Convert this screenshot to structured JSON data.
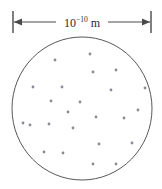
{
  "figure": {
    "colors": {
      "background": "#ffffff",
      "circle_stroke": "#575757",
      "dimension_line": "#4a4a4a",
      "particle": "#8a8a94",
      "label_text": "#2b2b2b"
    },
    "scale_bar": {
      "label_mantissa": "10",
      "label_exponent": "−10",
      "label_unit": "m",
      "label_full": "10⁻¹⁰ m",
      "left_x": 13,
      "right_x": 151,
      "line_y": 22,
      "tick_top_y": 11,
      "tick_bottom_y": 33,
      "arrow_direction": "double"
    },
    "circle": {
      "center_x": 82,
      "center_y": 108.5,
      "radius_x": 70,
      "radius_y": 71.5
    },
    "particles": [
      {
        "x": 90,
        "y": 54
      },
      {
        "x": 55,
        "y": 60
      },
      {
        "x": 93,
        "y": 72
      },
      {
        "x": 116,
        "y": 70
      },
      {
        "x": 33,
        "y": 87
      },
      {
        "x": 62,
        "y": 87
      },
      {
        "x": 111,
        "y": 90
      },
      {
        "x": 145,
        "y": 88
      },
      {
        "x": 51,
        "y": 101
      },
      {
        "x": 80,
        "y": 102
      },
      {
        "x": 23,
        "y": 123
      },
      {
        "x": 49,
        "y": 124
      },
      {
        "x": 96,
        "y": 117
      },
      {
        "x": 124,
        "y": 118
      },
      {
        "x": 73,
        "y": 128
      },
      {
        "x": 30,
        "y": 125
      },
      {
        "x": 99,
        "y": 144
      },
      {
        "x": 132,
        "y": 143
      },
      {
        "x": 44,
        "y": 152
      },
      {
        "x": 63,
        "y": 153
      },
      {
        "x": 93,
        "y": 164
      },
      {
        "x": 116,
        "y": 164
      },
      {
        "x": 138,
        "y": 110
      },
      {
        "x": 68,
        "y": 112
      }
    ],
    "particle_radius": 1.4,
    "particle_count": 24
  }
}
